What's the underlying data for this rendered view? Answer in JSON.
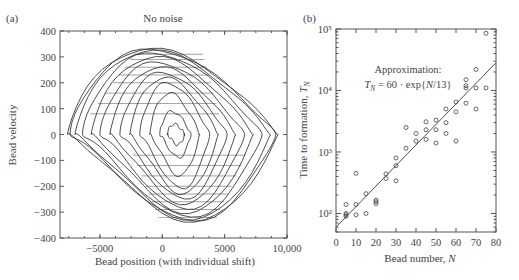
{
  "chart_data": [
    {
      "panel": "(a)",
      "type": "line",
      "title": "No noise",
      "xlabel": "Bead position (with individual shift)",
      "ylabel": "Bead velocity",
      "xlim": [
        -8200,
        10000
      ],
      "ylim": [
        -400,
        400
      ],
      "xticks": [
        -5000,
        0,
        5000,
        10000
      ],
      "xtick_labels": [
        "−5000",
        "0",
        "5000",
        "10,000"
      ],
      "yticks": [
        -400,
        -300,
        -200,
        -100,
        0,
        100,
        200,
        300,
        400
      ],
      "ytick_labels": [
        "−400",
        "−300",
        "−200",
        "−100",
        "0",
        "100",
        "200",
        "300",
        "400"
      ],
      "grid": false,
      "description": "Nested closed phase-space trajectories (one per bead) spiralling outward from center near (1000, 0) to outermost loop spanning x≈-7500..9200, v≈-340..330",
      "loops": [
        {
          "xmin": 400,
          "xmax": 1800,
          "vmax": 40,
          "vmin": -40
        },
        {
          "xmin": -200,
          "xmax": 2300,
          "vmax": 90,
          "vmin": -90
        },
        {
          "xmin": -1000,
          "xmax": 3000,
          "vmax": 160,
          "vmin": -160
        },
        {
          "xmin": -1800,
          "xmax": 3800,
          "vmax": 200,
          "vmin": -210
        },
        {
          "xmin": -2600,
          "xmax": 4500,
          "vmax": 220,
          "vmin": -230
        },
        {
          "xmin": -3400,
          "xmax": 5200,
          "vmax": 240,
          "vmin": -250
        },
        {
          "xmin": -4200,
          "xmax": 5900,
          "vmax": 260,
          "vmin": -270
        },
        {
          "xmin": -5000,
          "xmax": 6600,
          "vmax": 280,
          "vmin": -290
        },
        {
          "xmin": -5700,
          "xmax": 7300,
          "vmax": 300,
          "vmin": -305
        },
        {
          "xmin": -6400,
          "xmax": 8000,
          "vmax": 315,
          "vmin": -320
        },
        {
          "xmin": -7000,
          "xmax": 8700,
          "vmax": 325,
          "vmin": -330
        },
        {
          "xmin": -7400,
          "xmax": 9100,
          "vmax": 330,
          "vmin": -335
        },
        {
          "xmin": -7600,
          "xmax": 9300,
          "vmax": 332,
          "vmin": -338
        }
      ]
    },
    {
      "panel": "(b)",
      "type": "scatter",
      "title": "",
      "xlabel": "Bead number, N",
      "ylabel": "Time to formation, T_N",
      "xlim": [
        0,
        80
      ],
      "ylim": [
        50,
        100000
      ],
      "yscale": "log",
      "xticks": [
        0,
        10,
        20,
        30,
        40,
        50,
        60,
        70,
        80
      ],
      "xtick_labels": [
        "0",
        "10",
        "20",
        "30",
        "40",
        "50",
        "60",
        "70",
        "80"
      ],
      "yticks": [
        100,
        1000,
        10000,
        100000
      ],
      "ytick_labels": [
        "10²",
        "10³",
        "10⁴",
        "10⁵"
      ],
      "grid": false,
      "annotation": {
        "line1": "Approximation:",
        "line2": "T_N = 60 · exp{N/13}"
      },
      "fit": {
        "a": 60,
        "b": 13,
        "x_range": [
          0,
          80
        ]
      },
      "points": [
        {
          "x": 5,
          "y": 140
        },
        {
          "x": 5,
          "y": 100
        },
        {
          "x": 5,
          "y": 95
        },
        {
          "x": 5,
          "y": 90
        },
        {
          "x": 10,
          "y": 450
        },
        {
          "x": 10,
          "y": 140
        },
        {
          "x": 10,
          "y": 95
        },
        {
          "x": 15,
          "y": 210
        },
        {
          "x": 15,
          "y": 100
        },
        {
          "x": 20,
          "y": 165
        },
        {
          "x": 20,
          "y": 145
        },
        {
          "x": 20,
          "y": 155
        },
        {
          "x": 25,
          "y": 440
        },
        {
          "x": 25,
          "y": 370
        },
        {
          "x": 30,
          "y": 800
        },
        {
          "x": 30,
          "y": 600
        },
        {
          "x": 30,
          "y": 340
        },
        {
          "x": 35,
          "y": 2500
        },
        {
          "x": 35,
          "y": 1150
        },
        {
          "x": 40,
          "y": 2000
        },
        {
          "x": 40,
          "y": 1500
        },
        {
          "x": 45,
          "y": 3100
        },
        {
          "x": 45,
          "y": 2300
        },
        {
          "x": 45,
          "y": 1600
        },
        {
          "x": 50,
          "y": 2300
        },
        {
          "x": 50,
          "y": 1400
        },
        {
          "x": 50,
          "y": 3300
        },
        {
          "x": 55,
          "y": 5000
        },
        {
          "x": 55,
          "y": 3000
        },
        {
          "x": 55,
          "y": 2000
        },
        {
          "x": 60,
          "y": 6500
        },
        {
          "x": 60,
          "y": 1500
        },
        {
          "x": 60,
          "y": 4500
        },
        {
          "x": 65,
          "y": 15000
        },
        {
          "x": 65,
          "y": 12000
        },
        {
          "x": 65,
          "y": 11000
        },
        {
          "x": 65,
          "y": 6200
        },
        {
          "x": 70,
          "y": 22000
        },
        {
          "x": 70,
          "y": 11000
        },
        {
          "x": 70,
          "y": 5000
        },
        {
          "x": 75,
          "y": 85000
        },
        {
          "x": 75,
          "y": 11000
        }
      ]
    }
  ],
  "labels": {
    "panel_a": "(a)",
    "panel_b": "(b)",
    "title_a": "No noise",
    "xlabel_a": "Bead position (with individual shift)",
    "ylabel_a": "Bead velocity",
    "xlabel_b_text": "Bead number, ",
    "xlabel_b_var": "N",
    "ylabel_b_text": "Time to formation, ",
    "ylabel_b_var": "T",
    "ylabel_b_sub": "N",
    "approx_line1": "Approximation:",
    "approx_var": "T",
    "approx_sub": "N",
    "approx_rhs": " = 60 · exp{",
    "approx_n": "N",
    "approx_end": "/13}"
  },
  "colors": {
    "axis": "#555555",
    "line": "#3a3a3a",
    "marker": "#555555",
    "text": "#444444"
  }
}
